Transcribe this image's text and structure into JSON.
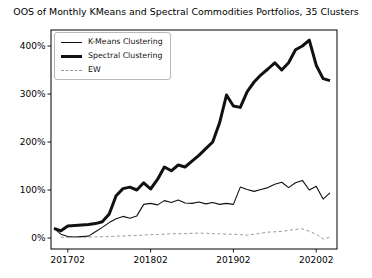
{
  "chart_data": {
    "type": "line",
    "title": "OOS of Monthly KMeans and Spectral Commodities Portfolios, 35 Clusters",
    "unit": "%",
    "grid": false,
    "legend_position": "upper-left",
    "x_axis": {
      "label": "",
      "months": [
        "201612",
        "201701",
        "201702",
        "201703",
        "201704",
        "201705",
        "201706",
        "201707",
        "201708",
        "201709",
        "201710",
        "201711",
        "201712",
        "201801",
        "201802",
        "201803",
        "201804",
        "201805",
        "201806",
        "201807",
        "201808",
        "201809",
        "201810",
        "201811",
        "201812",
        "201901",
        "201902",
        "201903",
        "201904",
        "201905",
        "201906",
        "201907",
        "201908",
        "201909",
        "201910",
        "201911",
        "201912",
        "202001",
        "202002",
        "202003",
        "202004"
      ],
      "tick_labels": [
        "201702",
        "201802",
        "201902",
        "202002"
      ],
      "tick_indices": [
        2,
        14,
        26,
        38
      ]
    },
    "y_axis": {
      "label": "",
      "tick_labels": [
        "0%",
        "100%",
        "200%",
        "300%",
        "400%"
      ],
      "tick_values": [
        0,
        100,
        200,
        300,
        400
      ],
      "ylim": [
        -23,
        433
      ]
    },
    "series": [
      {
        "name": "K-Means Clustering",
        "style": "thin-solid",
        "color": "#111111",
        "values": [
          20,
          8,
          3,
          2,
          3,
          4,
          13,
          22,
          32,
          40,
          45,
          41,
          46,
          70,
          72,
          69,
          78,
          74,
          79,
          73,
          72,
          75,
          71,
          74,
          70,
          72,
          70,
          106,
          101,
          97,
          101,
          105,
          112,
          116,
          105,
          115,
          120,
          100,
          108,
          81,
          94
        ]
      },
      {
        "name": "Spectral Clustering",
        "style": "thick-solid",
        "color": "#111111",
        "values": [
          20,
          15,
          25,
          26,
          27,
          28,
          30,
          34,
          50,
          88,
          103,
          106,
          100,
          115,
          102,
          122,
          148,
          140,
          152,
          148,
          160,
          172,
          186,
          200,
          240,
          298,
          275,
          272,
          305,
          325,
          340,
          352,
          365,
          350,
          365,
          392,
          400,
          412,
          360,
          332,
          328
        ]
      },
      {
        "name": "EW",
        "style": "dashed",
        "color": "#9a9a9a",
        "values": [
          null,
          2,
          1,
          1,
          1,
          2,
          2,
          3,
          3,
          4,
          4,
          5,
          5,
          6,
          7,
          7,
          8,
          9,
          9,
          9,
          10,
          10,
          10,
          9,
          9,
          8,
          8,
          7,
          6,
          8,
          10,
          12,
          13,
          14,
          16,
          18,
          19,
          14,
          8,
          -2,
          2
        ]
      }
    ]
  },
  "colors": {
    "background": "#ffffff",
    "frame": "#000000",
    "text": "#000000",
    "ew_line": "#9a9a9a"
  }
}
